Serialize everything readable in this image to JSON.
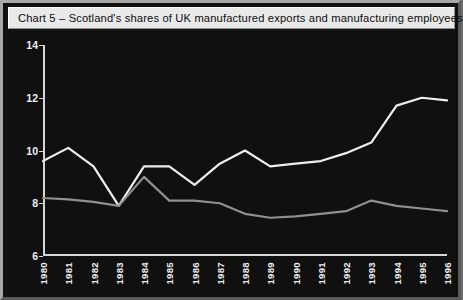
{
  "title": "Chart 5 – Scotland's shares of UK manufactured exports and manufacturing employees",
  "legend": [
    {
      "label": "Scottish share of UK manufacturing employees, %",
      "color": "#8f8f8f",
      "swatch": "legend-swatch-employees"
    },
    {
      "label": "Scottish share of UK manufactured exports, %",
      "color": "#eeeeee",
      "swatch": "legend-swatch-exports"
    }
  ],
  "colors": {
    "background": "#111010",
    "frame": "#8c8c8c",
    "titlebar": "#e9e9e9",
    "axis": "#d6d6d6",
    "exports_line": "#eeeeee",
    "employees_line": "#8f8f8f"
  },
  "chart_data": {
    "type": "line",
    "title": "Chart 5 – Scotland's shares of UK manufactured exports and manufacturing employees",
    "xlabel": "",
    "ylabel": "",
    "ylim": [
      6,
      14
    ],
    "yticks": [
      6,
      8,
      10,
      12,
      14
    ],
    "grid": false,
    "legend_position": "top-center",
    "categories": [
      "1980",
      "1981",
      "1982",
      "1983",
      "1984",
      "1985",
      "1986",
      "1987",
      "1988",
      "1989",
      "1990",
      "1991",
      "1992",
      "1993",
      "1994",
      "1995",
      "1996"
    ],
    "series": [
      {
        "name": "Scottish share of UK manufactured exports, %",
        "color": "#eeeeee",
        "values": [
          9.6,
          10.1,
          9.4,
          7.9,
          9.4,
          9.4,
          8.7,
          9.5,
          10.0,
          9.4,
          9.5,
          9.6,
          9.9,
          10.3,
          11.7,
          12.0,
          11.9
        ]
      },
      {
        "name": "Scottish share of UK manufacturing employees, %",
        "color": "#8f8f8f",
        "values": [
          8.2,
          8.15,
          8.05,
          7.9,
          9.0,
          8.1,
          8.1,
          8.0,
          7.6,
          7.45,
          7.5,
          7.6,
          7.7,
          8.1,
          7.9,
          7.8,
          7.7
        ]
      }
    ]
  }
}
